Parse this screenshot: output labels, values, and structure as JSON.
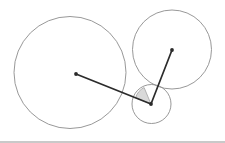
{
  "figure": {
    "background_color": "#ffffff",
    "width": 225,
    "height": 143,
    "circle_stroke_color": "#8c8c8c",
    "circle_stroke_width": 0.9,
    "segment_color": "#2b2b2b",
    "segment_width": 1.7,
    "dot_color": "#2b2b2b",
    "dot_radius": 1.9,
    "sector_fill_color": "#d9d9d9",
    "sector_stroke_color": "#8c8c8c",
    "baseline_color": "#c9c9c9"
  },
  "circles": [
    {
      "name": "large-left-circle",
      "cx": 70,
      "cy": 72.5,
      "r": 56
    },
    {
      "name": "upper-right-circle",
      "cx": 172,
      "cy": 49.5,
      "r": 39.5
    },
    {
      "name": "small-bottom-circle",
      "cx": 151.5,
      "cy": 104,
      "r": 19.5
    }
  ],
  "points": [
    {
      "name": "large-circle-center-point",
      "x": 76,
      "y": 74
    },
    {
      "name": "upper-right-circle-center-point",
      "x": 172,
      "y": 50
    },
    {
      "name": "vertex-point",
      "x": 151,
      "y": 104
    }
  ],
  "segments": [
    {
      "name": "segment-to-large-circle-center",
      "x1": 151,
      "y1": 104,
      "x2": 76,
      "y2": 74
    },
    {
      "name": "segment-to-upper-right-circle-center",
      "x1": 151,
      "y1": 104,
      "x2": 172,
      "y2": 50
    }
  ],
  "sector": {
    "name": "shaded-angle-sector",
    "path": "M 151 104 L 135.6 97.8 A 17 17 0 0 1 144.1 87.5 L 151 104 Z",
    "fill": "#d9d9d9"
  }
}
